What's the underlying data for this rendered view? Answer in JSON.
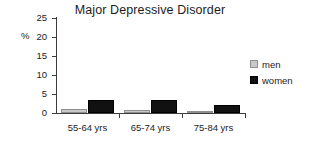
{
  "chart_data": {
    "type": "bar",
    "title": "Major Depressive Disorder",
    "xlabel": "",
    "ylabel": "%",
    "categories": [
      "55-64 yrs",
      "65-74 yrs",
      "75-84 yrs"
    ],
    "series": [
      {
        "name": "men",
        "color": "#c9c9c9",
        "values": [
          1.1,
          0.9,
          0.4
        ]
      },
      {
        "name": "women",
        "color": "#111111",
        "values": [
          3.3,
          3.5,
          2.1
        ]
      }
    ],
    "ylim": [
      0,
      25
    ],
    "yticks": [
      0,
      5,
      10,
      15,
      20,
      25
    ],
    "ytick_labels": [
      "0",
      "5",
      "10",
      "15",
      "20",
      "25"
    ],
    "grid": false,
    "legend_position": "right"
  },
  "legend": {
    "entries": [
      {
        "label": "men"
      },
      {
        "label": "women"
      }
    ]
  }
}
